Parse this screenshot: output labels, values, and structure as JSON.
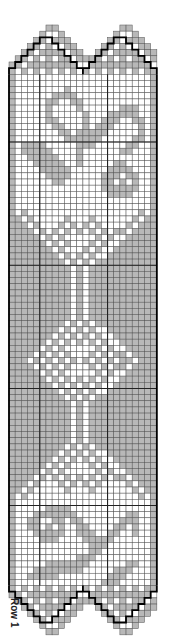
{
  "chart": {
    "row_label": "Row 1",
    "colors": {
      "filled": "#b8b8b8",
      "open": "#ffffff",
      "grid": "#555555",
      "outline": "#000000"
    },
    "cols": 24,
    "cell": 6.16,
    "origin_x": 9,
    "origin_y": 25,
    "thick_every_cols": [
      5,
      16
    ],
    "thick_rows": [
      17,
      37,
      57,
      76
    ],
    "legend": {
      "filled": "block (dc)",
      "open": "space (ch)"
    }
  },
  "pattern_rows": [
    "000000110000000000110000",
    "000001001000000001001000",
    "000011011100000011011100",
    "000110100110000110100110",
    "001101111011001101111011",
    "011010101101111010101101",
    "110111111110011111111110",
    "101010101010101010101011",
    "100000000000000000000001",
    "100000000000000000000001",
    "100000000100000000000001",
    "100000011110000000000001",
    "100000110011000000000001",
    "100000100001000000111001",
    "100000100000100011111001",
    "100000110000100111001101",
    "100000011000101110000101",
    "100000001101111100000101",
    "100000000111111000001101",
    "101111000001110000011001",
    "101111100001000000110001",
    "100111110001000000000001",
    "100011111001000001100001",
    "100001111100000011110001",
    "100000111100000111011001",
    "100000011000000110101001",
    "100000000000000111111001",
    "100000000000000011110001",
    "100000000000000000000001",
    "100000000000000000000001",
    "101000000000000000000101",
    "110100000100010000001011",
    "111010001010101000010111",
    "111101010101010101101111",
    "111110101000001010011111",
    "111111010100010100111111",
    "111111101000101001111111",
    "111111110101010011111111",
    "111111111010101111111111",
    "111111111101011111111111",
    "111111111101011111111111",
    "111111111101011111111111",
    "111111111101011111111111",
    "111111111101011111111111",
    "111111111101011111111111",
    "111111111101011111111111",
    "111111111101011111111111",
    "111111111101011111111111",
    "111111111010101111111111",
    "111111110101010011111111",
    "111111101010101001111111",
    "111111010101010100111111",
    "111110101000001010011111",
    "111101010100010101101111",
    "111010101010101010110111",
    "111101010100010101101111",
    "111110101000001010011111",
    "111111010101010100111111",
    "111111101010101001111111",
    "111111110101010011111111",
    "111111111010101111111111",
    "111111111101011111111111",
    "111111111101011111111111",
    "111111111101011111111111",
    "111111111101011111111111",
    "111111111101011111111111",
    "111111111101011111111111",
    "111111111101011111111111",
    "111111111010101111111111",
    "111111110101010011111111",
    "111111101010101001111111",
    "111111010100010100111111",
    "111110101000001010011111",
    "111101010101010101101111",
    "111010001010101000010111",
    "110100000100010000001011",
    "101000000000000000000101",
    "100000000000000000000001",
    "100000111100000000000001",
    "100011111110000000011001",
    "100110011011000000111001",
    "100110101001100001101001",
    "100011111001110011001001",
    "100001110000111110000001",
    "100000000000011100000001",
    "100000000000011000000001",
    "100000000001110000000001",
    "100000111111100000011001",
    "100011111111000001110001",
    "100111110000000011100001",
    "100000000000000111000001",
    "101010101010101010101011",
    "110111111110011111111110",
    "011010101101111010101101",
    "001101111011001101111011",
    "000110100110000110100110",
    "000011011100000011011100",
    "000001001000000001001000",
    "000000110000000000110000"
  ]
}
